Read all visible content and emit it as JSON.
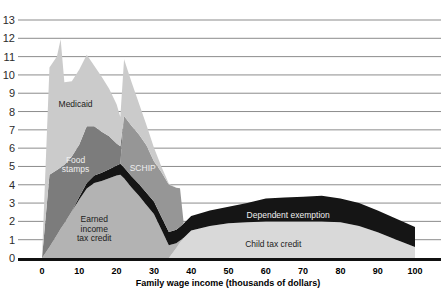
{
  "chart_data": {
    "type": "area",
    "title": "",
    "xlabel": "Family wage income (thousands of dollars)",
    "ylabel": "",
    "xlim": [
      0,
      100
    ],
    "ylim": [
      0,
      13
    ],
    "xticks": [
      "0",
      "10",
      "20",
      "30",
      "40",
      "50",
      "60",
      "70",
      "80",
      "90",
      "100"
    ],
    "yticks": [
      "0",
      "1",
      "2",
      "3",
      "4",
      "5",
      "6",
      "7",
      "8",
      "9",
      "10",
      "11",
      "12",
      "13"
    ],
    "grid": true,
    "legend_position": "inline-labels",
    "stacked": true,
    "x": [
      0,
      2,
      4,
      5,
      6,
      8,
      10,
      12,
      14,
      16,
      18,
      20,
      21,
      22,
      24,
      26,
      28,
      30,
      32,
      34,
      36,
      37,
      38,
      40,
      45,
      50,
      55,
      60,
      65,
      70,
      75,
      80,
      85,
      90,
      95,
      100
    ],
    "series": [
      {
        "name": "Child tax credit",
        "color": "#d9d9d9",
        "label_x": 62,
        "label_y": 0.75,
        "values": [
          0,
          0,
          0,
          0,
          0,
          0,
          0,
          0,
          0,
          0,
          0,
          0,
          0,
          0,
          0,
          0,
          0,
          0,
          0,
          0,
          0.55,
          0.85,
          1.1,
          1.5,
          1.75,
          1.9,
          1.95,
          2.0,
          2.0,
          2.0,
          2.0,
          1.95,
          1.75,
          1.4,
          1.0,
          0.6
        ]
      },
      {
        "name": "Earned income tax credit",
        "color": "#b3b3b3",
        "label_x": 14,
        "label_y": 1.6,
        "values": [
          0,
          0.6,
          1.25,
          1.6,
          1.9,
          2.55,
          3.2,
          3.8,
          4.1,
          4.2,
          4.35,
          4.5,
          4.55,
          4.35,
          3.85,
          3.4,
          2.9,
          2.4,
          1.55,
          0.7,
          0.25,
          0.1,
          0,
          0,
          0,
          0,
          0,
          0,
          0,
          0,
          0,
          0,
          0,
          0,
          0,
          0
        ]
      },
      {
        "name": "Dependent exemption",
        "color": "#151515",
        "label_x": 66,
        "label_y": 2.35,
        "values": [
          0,
          0,
          0,
          0,
          0,
          0,
          0.15,
          0.3,
          0.4,
          0.45,
          0.5,
          0.55,
          0.6,
          0.6,
          0.62,
          0.64,
          0.66,
          0.68,
          0.7,
          0.72,
          0.74,
          0.76,
          0.78,
          0.8,
          0.85,
          0.9,
          1.05,
          1.25,
          1.3,
          1.35,
          1.4,
          1.3,
          1.25,
          1.2,
          1.15,
          1.1
        ]
      },
      {
        "name": "SCHIP",
        "color": "#969696",
        "label_x": 27,
        "label_y": 4.9,
        "values": [
          0,
          0,
          0,
          0,
          0,
          0,
          0,
          0,
          0,
          0,
          0,
          0,
          0,
          2.8,
          2.75,
          2.7,
          2.6,
          2.2,
          2.45,
          2.6,
          2.3,
          2.1,
          0,
          0,
          0,
          0,
          0,
          0,
          0,
          0,
          0,
          0,
          0,
          0,
          0,
          0
        ]
      },
      {
        "name": "Food stamps",
        "color": "#7c7c7c",
        "label_x": 9,
        "label_y": 5.1,
        "values": [
          0,
          3.95,
          3.55,
          3.35,
          3.2,
          3.0,
          2.85,
          3.1,
          2.7,
          2.25,
          1.8,
          1.2,
          0.95,
          0,
          0,
          0,
          0,
          0,
          0,
          0,
          0,
          0,
          0,
          0,
          0,
          0,
          0,
          0,
          0,
          0,
          0,
          0,
          0,
          0,
          0,
          0
        ]
      },
      {
        "name": "Medicaid",
        "color": "#cbcbcb",
        "label_x": 9,
        "label_y": 8.4,
        "values": [
          0,
          5.85,
          6.2,
          7.0,
          4.5,
          4.1,
          4.1,
          3.9,
          3.3,
          3.0,
          2.6,
          2.15,
          1.6,
          3.1,
          2.4,
          1.7,
          1.1,
          0.75,
          0.3,
          0.05,
          0,
          0,
          0,
          0,
          0,
          0,
          0,
          0,
          0,
          0,
          0,
          0,
          0,
          0,
          0,
          0
        ]
      }
    ],
    "area_labels": [
      {
        "name": "Medicaid",
        "text": "Medicaid",
        "lines": [
          "Medicaid"
        ],
        "tone": "dark"
      },
      {
        "name": "Food stamps",
        "text": "Food stamps",
        "lines": [
          "Food",
          "stamps"
        ],
        "tone": "light"
      },
      {
        "name": "SCHIP",
        "text": "SCHIP",
        "lines": [
          "SCHIP"
        ],
        "tone": "light"
      },
      {
        "name": "Earned income tax credit",
        "text": "Earned income tax credit",
        "lines": [
          "Earned",
          "income",
          "tax credit"
        ],
        "tone": "dark"
      },
      {
        "name": "Dependent exemption",
        "text": "Dependent exemption",
        "lines": [
          "Dependent exemption"
        ],
        "tone": "light"
      },
      {
        "name": "Child tax credit",
        "text": "Child tax credit",
        "lines": [
          "Child tax credit"
        ],
        "tone": "dark"
      }
    ]
  },
  "axis": {
    "x_title": "Family wage income (thousands of dollars)"
  }
}
